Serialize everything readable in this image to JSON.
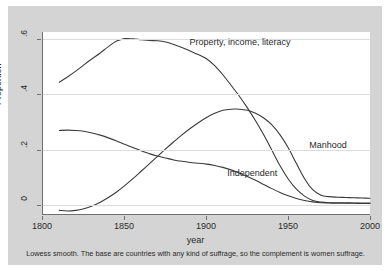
{
  "chart_data": {
    "type": "line",
    "title": "",
    "xlabel": "year",
    "ylabel": "Proportion",
    "xlim": [
      1800,
      2000
    ],
    "ylim": [
      -0.035,
      0.625
    ],
    "grid": true,
    "legend_position": "inline-annotations",
    "xticks": [
      1800,
      1850,
      1900,
      1950,
      2000
    ],
    "xtick_labels": [
      "1800",
      "1850",
      "1900",
      "1950",
      "2000"
    ],
    "yticks": [
      0,
      0.2,
      0.4,
      0.6
    ],
    "ytick_labels": [
      "0",
      ".2",
      ".4",
      ".6"
    ],
    "note": "Lowess smooth. The base are countries with any kind of suffrage, so the complement is women suffrage.",
    "series": [
      {
        "name": "Property, income, literacy",
        "label": "Property, income, literacy",
        "color": "#3a3a3a",
        "label_x": 1890,
        "label_y": 0.585,
        "x": [
          1810,
          1815,
          1820,
          1825,
          1830,
          1835,
          1840,
          1845,
          1850,
          1855,
          1860,
          1865,
          1870,
          1875,
          1880,
          1885,
          1890,
          1895,
          1900,
          1905,
          1910,
          1915,
          1920,
          1925,
          1930,
          1935,
          1940,
          1945,
          1950,
          1955,
          1960,
          1965,
          1970,
          1975,
          1980,
          1985,
          1990,
          1995,
          2000
        ],
        "y": [
          0.443,
          0.462,
          0.483,
          0.506,
          0.528,
          0.549,
          0.572,
          0.592,
          0.601,
          0.6,
          0.597,
          0.594,
          0.593,
          0.589,
          0.58,
          0.569,
          0.556,
          0.543,
          0.528,
          0.503,
          0.47,
          0.432,
          0.393,
          0.35,
          0.303,
          0.252,
          0.196,
          0.14,
          0.092,
          0.055,
          0.03,
          0.014,
          0.008,
          0.006,
          0.006,
          0.006,
          0.005,
          0.005,
          0.005
        ]
      },
      {
        "name": "Manhood",
        "label": "Manhood",
        "color": "#3a3a3a",
        "label_x": 1963,
        "label_y": 0.215,
        "x": [
          1810,
          1815,
          1820,
          1825,
          1830,
          1835,
          1840,
          1845,
          1850,
          1855,
          1860,
          1865,
          1870,
          1875,
          1880,
          1885,
          1890,
          1895,
          1900,
          1905,
          1910,
          1915,
          1920,
          1925,
          1930,
          1935,
          1940,
          1945,
          1950,
          1955,
          1960,
          1965,
          1970,
          1975,
          1980,
          1985,
          1990,
          1995,
          2000
        ],
        "y": [
          -0.022,
          -0.024,
          -0.022,
          -0.016,
          -0.006,
          0.008,
          0.025,
          0.045,
          0.068,
          0.093,
          0.12,
          0.147,
          0.174,
          0.201,
          0.227,
          0.252,
          0.275,
          0.296,
          0.315,
          0.33,
          0.341,
          0.345,
          0.345,
          0.341,
          0.33,
          0.313,
          0.288,
          0.252,
          0.205,
          0.148,
          0.093,
          0.053,
          0.033,
          0.028,
          0.026,
          0.025,
          0.024,
          0.023,
          0.022
        ]
      },
      {
        "name": "Independent",
        "label": "Independent",
        "color": "#3a3a3a",
        "label_x": 1913,
        "label_y": 0.113,
        "x": [
          1810,
          1815,
          1820,
          1825,
          1830,
          1835,
          1840,
          1845,
          1850,
          1855,
          1860,
          1865,
          1870,
          1875,
          1880,
          1885,
          1890,
          1895,
          1900,
          1905,
          1910,
          1915,
          1920,
          1925,
          1930,
          1935,
          1940,
          1945,
          1950,
          1955,
          1960,
          1965,
          1970,
          1975,
          1980,
          1985,
          1990,
          1995,
          2000
        ],
        "y": [
          0.268,
          0.269,
          0.268,
          0.265,
          0.259,
          0.251,
          0.241,
          0.23,
          0.218,
          0.206,
          0.194,
          0.184,
          0.175,
          0.168,
          0.161,
          0.156,
          0.152,
          0.149,
          0.146,
          0.141,
          0.134,
          0.125,
          0.114,
          0.101,
          0.087,
          0.072,
          0.057,
          0.043,
          0.031,
          0.021,
          0.014,
          0.009,
          0.006,
          0.005,
          0.004,
          0.004,
          0.004,
          0.003,
          0.003
        ]
      }
    ]
  }
}
